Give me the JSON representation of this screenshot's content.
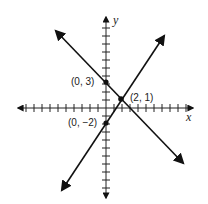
{
  "diagram": {
    "type": "coordinate-plane",
    "axes": {
      "x_label": "x",
      "y_label": "y"
    },
    "points": [
      {
        "label": "(0, 3)",
        "x": 0,
        "y": 3
      },
      {
        "label": "(2, 1)",
        "x": 2,
        "y": 1
      },
      {
        "label": "(0, −2)",
        "x": 0,
        "y": -2
      }
    ],
    "lines": [
      {
        "name": "line-through-0-3-and-2-1",
        "slope": -1,
        "intercept": 3
      },
      {
        "name": "line-through-0-neg2-and-2-1",
        "slope": 1.5,
        "intercept": -2
      }
    ],
    "colors": {
      "stroke": "#111111",
      "background": "#ffffff"
    }
  }
}
